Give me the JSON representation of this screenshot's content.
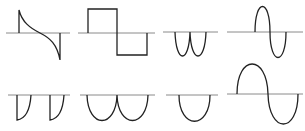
{
  "diagram": {
    "title": "",
    "colors": {
      "background": "#ffffff",
      "axis": "#8a8a8a",
      "waveform": "#222222"
    },
    "panels": [
      {
        "id": "p1",
        "row": 1,
        "col": 1,
        "shape": "spike-decay-to-negative-spike"
      },
      {
        "id": "p2",
        "row": 1,
        "col": 2,
        "shape": "square-wave-one-cycle"
      },
      {
        "id": "p3",
        "row": 1,
        "col": 3,
        "shape": "full-wave-rectified-negative"
      },
      {
        "id": "p4",
        "row": 1,
        "col": 4,
        "shape": "sine-one-cycle-narrow"
      },
      {
        "id": "p5",
        "row": 2,
        "col": 1,
        "shape": "sawtooth-negative-quarter-lobes"
      },
      {
        "id": "p6",
        "row": 2,
        "col": 2,
        "shape": "full-wave-rectified-negative-wide"
      },
      {
        "id": "p7",
        "row": 2,
        "col": 3,
        "shape": "half-wave-negative-lobe"
      },
      {
        "id": "p8",
        "row": 2,
        "col": 4,
        "shape": "sine-one-cycle-wide"
      }
    ]
  }
}
